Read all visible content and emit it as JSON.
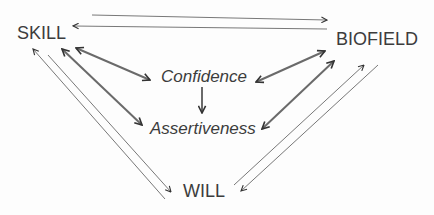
{
  "diagram": {
    "nodes": {
      "skill": "SKILL",
      "biofield": "BIOFIELD",
      "will": "WILL",
      "confidence": "Confidence",
      "assertiveness": "Assertiveness"
    },
    "edges": [
      {
        "from": "SKILL",
        "to": "BIOFIELD",
        "style": "thin",
        "arrow": "end"
      },
      {
        "from": "BIOFIELD",
        "to": "SKILL",
        "style": "thin",
        "arrow": "end"
      },
      {
        "from": "SKILL",
        "to": "Confidence",
        "style": "bold",
        "arrow": "both"
      },
      {
        "from": "SKILL",
        "to": "Assertiveness",
        "style": "bold",
        "arrow": "both"
      },
      {
        "from": "BIOFIELD",
        "to": "Confidence",
        "style": "bold",
        "arrow": "both"
      },
      {
        "from": "BIOFIELD",
        "to": "Assertiveness",
        "style": "bold",
        "arrow": "both"
      },
      {
        "from": "Confidence",
        "to": "Assertiveness",
        "style": "bold",
        "arrow": "end"
      },
      {
        "from": "WILL",
        "to": "SKILL",
        "style": "thin",
        "arrow": "end"
      },
      {
        "from": "SKILL",
        "to": "WILL",
        "style": "thin",
        "arrow": "end"
      },
      {
        "from": "WILL",
        "to": "BIOFIELD",
        "style": "thin",
        "arrow": "end"
      },
      {
        "from": "BIOFIELD",
        "to": "WILL",
        "style": "thin",
        "arrow": "end"
      }
    ],
    "colors": {
      "text": "#3c3c3c",
      "bold_line": "#6a6a6a",
      "thin_line": "#555555"
    }
  }
}
